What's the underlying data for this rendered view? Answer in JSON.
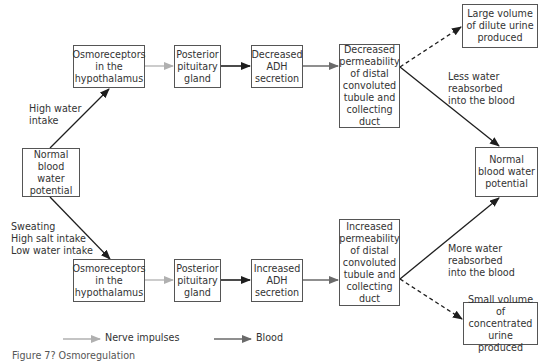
{
  "diagram": {
    "colors": {
      "nerve": "#b0b0b0",
      "blood": "#3a3a3a",
      "box_border": "#555555",
      "text": "#333333"
    },
    "boxes": {
      "normal_left": "Normal\nblood water\npotential",
      "osmo_top": "Osmoreceptors\nin the\nhypothalamus",
      "posterior_top": "Posterior\npituitary\ngland",
      "adh_decreased": "Decreased\nADH\nsecretion",
      "perm_decreased": "Decreased\npermeability\nof distal\nconvoluted\ntubule and\ncollecting\nduct",
      "large_volume": "Large volume\nof dilute urine\nproduced",
      "normal_right": "Normal\nblood water\npotential",
      "osmo_bottom": "Osmoreceptors\nin the\nhypothalamus",
      "posterior_bottom": "Posterior\npituitary\ngland",
      "adh_increased": "Increased\nADH\nsecretion",
      "perm_increased": "Increased\npermeability\nof distal\nconvoluted\ntubule and\ncollecting\nduct",
      "small_volume": "Small volume of\nconcentrated\nurine produced"
    },
    "labels": {
      "high_water": "High water\nintake",
      "dehydration": "Sweating\nHigh salt intake\nLow water intake",
      "less_water": "Less water\nreabsorbed\ninto the blood",
      "more_water": "More water\nreabsorbed\ninto the blood"
    },
    "legend": {
      "nerve": "Nerve impulses",
      "blood": "Blood"
    },
    "caption": "Figure 7? Osmoregulation"
  }
}
